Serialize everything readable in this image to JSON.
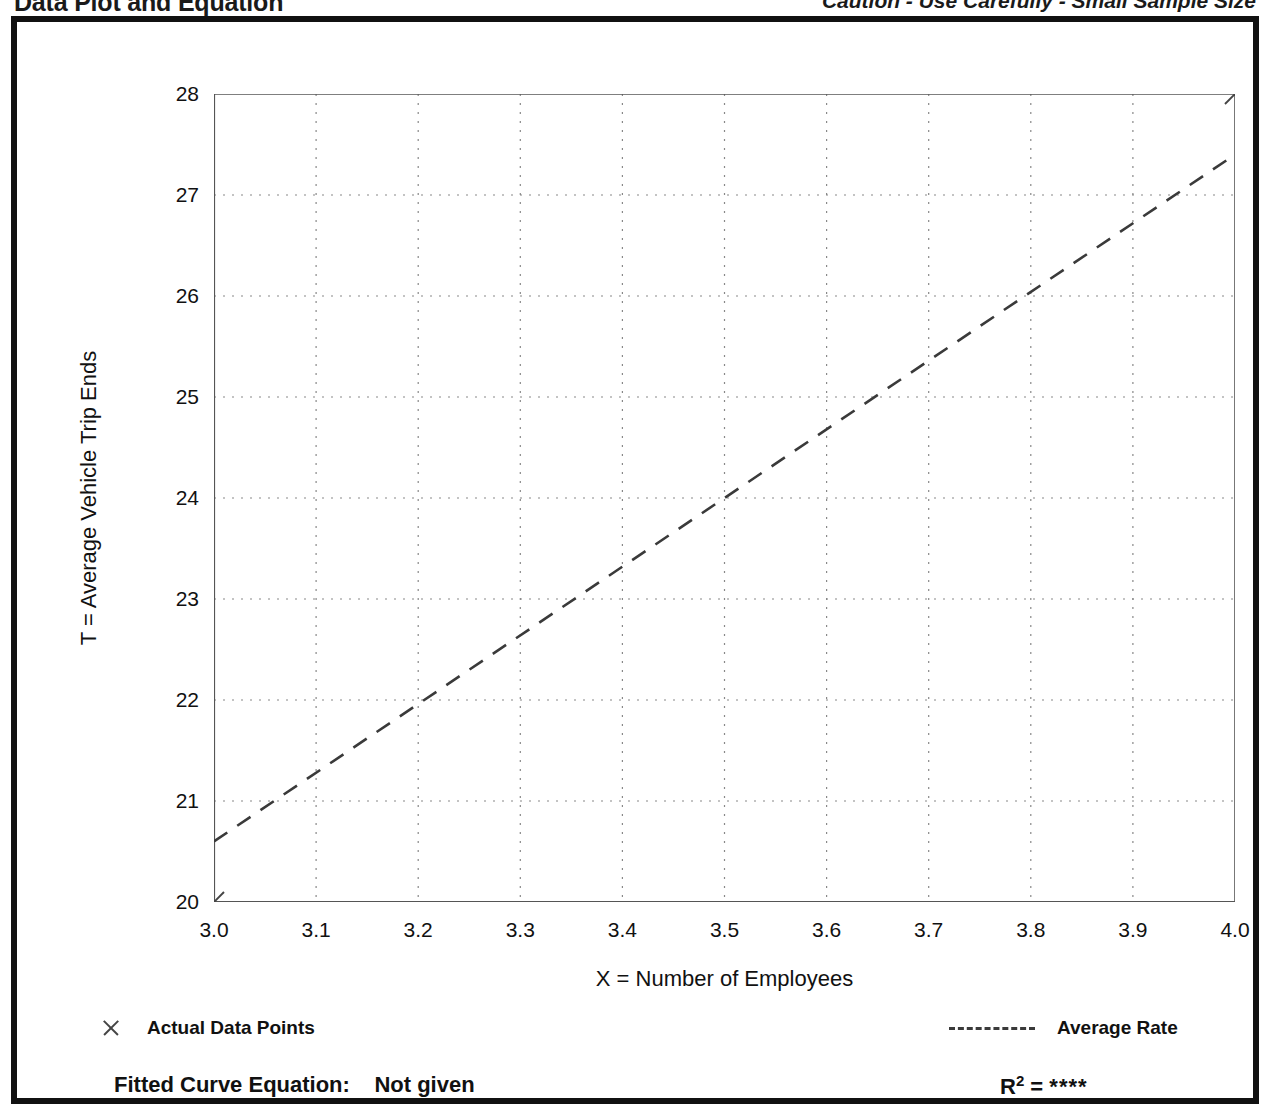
{
  "header": {
    "title": "Data Plot and Equation",
    "caution": "Caution - Use Carefully - Small Sample Size"
  },
  "legend": {
    "data_points_label": "Actual Data Points",
    "data_points_icon": "x-mark-icon",
    "average_rate_label": "Average Rate",
    "average_rate_icon": "dashed-line-icon"
  },
  "footer": {
    "equation_label": "Fitted Curve Equation:",
    "equation_value": "Not given",
    "r2_label": "R",
    "r2_exponent": "2",
    "r2_equals": "=",
    "r2_value": "****"
  },
  "colors": {
    "frame": "#111111",
    "axis": "#555555",
    "grid": "#888888",
    "series": "#3a3a3a",
    "marker": "#444444",
    "background": "#ffffff"
  },
  "chart_data": {
    "type": "line",
    "title": "Data Plot and Equation",
    "subtitle": "Caution - Use Carefully - Small Sample Size",
    "xlabel": "X = Number of Employees",
    "ylabel": "T = Average Vehicle Trip Ends",
    "xlim": [
      3.0,
      4.0
    ],
    "ylim": [
      20,
      28
    ],
    "xticks": [
      3.0,
      3.1,
      3.2,
      3.3,
      3.4,
      3.5,
      3.6,
      3.7,
      3.8,
      3.9,
      4.0
    ],
    "xtick_labels": [
      "3.0",
      "3.1",
      "3.2",
      "3.3",
      "3.4",
      "3.5",
      "3.6",
      "3.7",
      "3.8",
      "3.9",
      "4.0"
    ],
    "yticks": [
      20,
      21,
      22,
      23,
      24,
      25,
      26,
      27,
      28
    ],
    "ytick_labels": [
      "20",
      "21",
      "22",
      "23",
      "24",
      "25",
      "26",
      "27",
      "28"
    ],
    "x_minor_step": 0.05,
    "y_minor_step": 0.5,
    "grid": true,
    "grid_style": "dotted",
    "legend_position": "below-plot",
    "series": [
      {
        "name": "Actual Data Points",
        "type": "scatter",
        "marker": "x",
        "points": [
          {
            "x": 3.0,
            "y": 20.0
          },
          {
            "x": 4.0,
            "y": 28.0
          }
        ]
      },
      {
        "name": "Average Rate",
        "type": "line",
        "style": "dashed",
        "points": [
          {
            "x": 3.0,
            "y": 20.6
          },
          {
            "x": 4.0,
            "y": 27.4
          }
        ]
      }
    ],
    "fitted_curve_equation": "Not given",
    "r_squared": "****"
  }
}
